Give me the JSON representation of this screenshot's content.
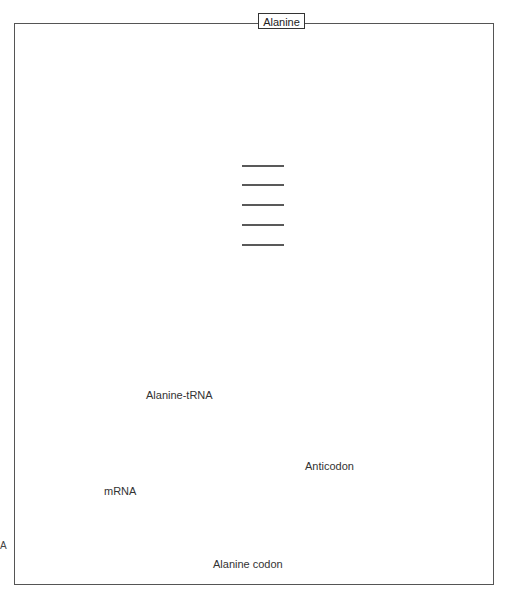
{
  "figure": {
    "amino_acid_label": "Alanine",
    "trna_label": "Alanine-tRNA",
    "mrna_label": "mRNA",
    "anticodon_label": "Anticodon",
    "codon_label": "Alanine codon",
    "edge_mark": "A",
    "anticodon_bases": [
      "C",
      "G",
      "U"
    ],
    "codon_bases": [
      "G",
      "C",
      "A"
    ]
  },
  "colors": {
    "trna_bead": "#4a4a4a",
    "mrna_bead": "#a8a8a8",
    "highlight_bead": "#cfcfcf",
    "bead_stroke": "#111111",
    "bond": "#222222",
    "frame": "#555555"
  },
  "beads": {
    "radius": 11,
    "acceptor_strand_3prime": [
      [
        284,
        52
      ],
      [
        284,
        71
      ],
      [
        284,
        90
      ],
      [
        284,
        109
      ],
      [
        284,
        128
      ],
      [
        284,
        147
      ],
      [
        284,
        166
      ],
      [
        284,
        185
      ],
      [
        284,
        205
      ],
      [
        284,
        225
      ],
      [
        284,
        245
      ],
      [
        284,
        266
      ],
      [
        284,
        287
      ]
    ],
    "d_arm_stem_top": [
      [
        242,
        166
      ],
      [
        242,
        185
      ],
      [
        242,
        205
      ],
      [
        242,
        225
      ],
      [
        242,
        245
      ],
      [
        242,
        266
      ]
    ],
    "d_arm_link": [
      [
        224,
        289
      ],
      [
        205,
        291
      ]
    ],
    "left_arm_top": [
      [
        197,
        308
      ],
      [
        176,
        308
      ],
      [
        155,
        308
      ],
      [
        134,
        308
      ]
    ],
    "left_loop": [
      [
        119,
        297
      ],
      [
        100,
        289
      ],
      [
        81,
        297
      ],
      [
        68,
        315
      ],
      [
        68,
        336
      ],
      [
        81,
        354
      ],
      [
        100,
        358
      ],
      [
        119,
        352
      ]
    ],
    "left_arm_bottom": [
      [
        134,
        341
      ],
      [
        155,
        341
      ],
      [
        176,
        341
      ],
      [
        197,
        341
      ]
    ],
    "ac_link_left": [
      [
        210,
        354
      ]
    ],
    "ac_stem_left": [
      [
        230,
        359
      ],
      [
        230,
        379
      ],
      [
        230,
        399
      ],
      [
        230,
        419
      ],
      [
        230,
        439
      ]
    ],
    "ac_loop_left": [
      [
        216,
        449
      ],
      [
        218,
        466
      ]
    ],
    "ac_loop_right": [
      [
        281,
        449
      ],
      [
        280,
        466
      ]
    ],
    "ac_stem_right": [
      [
        261,
        359
      ],
      [
        261,
        379
      ],
      [
        261,
        399
      ],
      [
        261,
        419
      ],
      [
        261,
        439
      ]
    ],
    "variable_loop": [
      [
        280,
        366
      ],
      [
        296,
        380
      ],
      [
        303,
        356
      ],
      [
        313,
        374
      ],
      [
        307,
        341
      ]
    ],
    "right_arm_bottom": [
      [
        296,
        341
      ],
      [
        317,
        341
      ],
      [
        338,
        341
      ],
      [
        359,
        341
      ],
      [
        380,
        341
      ]
    ],
    "right_loop": [
      [
        390,
        351
      ],
      [
        409,
        353
      ],
      [
        427,
        345
      ],
      [
        433,
        327
      ],
      [
        427,
        309
      ],
      [
        410,
        296
      ],
      [
        391,
        294
      ]
    ],
    "right_arm_top": [
      [
        380,
        308
      ],
      [
        359,
        308
      ],
      [
        338,
        308
      ],
      [
        317,
        308
      ],
      [
        296,
        308
      ]
    ],
    "connector_top": [
      [
        264,
        289
      ],
      [
        284,
        289
      ]
    ]
  },
  "anticodon": {
    "positions": [
      [
        228,
        487
      ],
      [
        248,
        491
      ],
      [
        268,
        487
      ]
    ]
  },
  "mrna": {
    "y": 523,
    "left_positions": [
      88,
      108,
      128,
      148,
      168,
      188,
      208
    ],
    "codon_positions": [
      228,
      248,
      268
    ],
    "right_positions": [
      288,
      308,
      328,
      348,
      368,
      388,
      408,
      428
    ],
    "dash_left": [
      40,
      76
    ],
    "dash_right": [
      440,
      476
    ]
  }
}
